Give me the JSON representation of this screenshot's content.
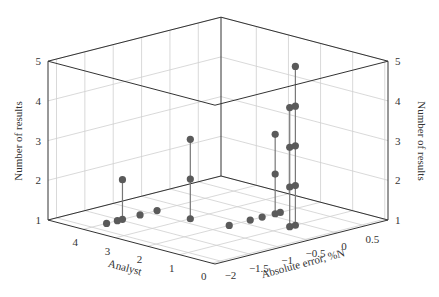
{
  "chart_data": {
    "type": "scatter",
    "projection": "3d-stem",
    "title": "",
    "xlabel": "Absolute error, %N",
    "ylabel": "Analyst",
    "zlabel": "Number of results",
    "xlim": [
      -2.15,
      0.9
    ],
    "ylim": [
      -0.1,
      5.1
    ],
    "zlim": [
      1,
      5
    ],
    "xticks": [
      -2,
      -1.5,
      -1,
      -0.5,
      0,
      0.5
    ],
    "xtick_labels": [
      "−2",
      "−1.5",
      "−1",
      "−0.5",
      "0",
      "0.5"
    ],
    "yticks": [
      0,
      1,
      2,
      3,
      4
    ],
    "ytick_labels": [
      "0",
      "1",
      "2",
      "3",
      "4"
    ],
    "zticks": [
      1,
      2,
      3,
      4,
      5
    ],
    "ztick_labels": [
      "1",
      "2",
      "3",
      "4",
      "5"
    ],
    "grid": true,
    "points": [
      {
        "analyst": 4,
        "error": -1.74,
        "count": 1
      },
      {
        "analyst": 4,
        "error": -1.55,
        "count": 1
      },
      {
        "analyst": 4,
        "error": -1.46,
        "count": 2
      },
      {
        "analyst": 4,
        "error": -1.15,
        "count": 1
      },
      {
        "analyst": 4,
        "error": -0.85,
        "count": 1
      },
      {
        "analyst": 3,
        "error": -0.83,
        "count": 3
      },
      {
        "analyst": 2,
        "error": -0.71,
        "count": 1
      },
      {
        "analyst": 2,
        "error": -0.34,
        "count": 1
      },
      {
        "analyst": 2,
        "error": -0.13,
        "count": 1
      },
      {
        "analyst": 2,
        "error": 0.1,
        "count": 3
      },
      {
        "analyst": 2,
        "error": 0.19,
        "count": 1
      },
      {
        "analyst": 1,
        "error": -0.21,
        "count": 4
      },
      {
        "analyst": 1,
        "error": -0.11,
        "count": 5
      }
    ],
    "colors": {
      "marker": "#5a5a5a",
      "stem": "#777777",
      "box": "#333333",
      "grid": "#cfcfcf"
    }
  }
}
